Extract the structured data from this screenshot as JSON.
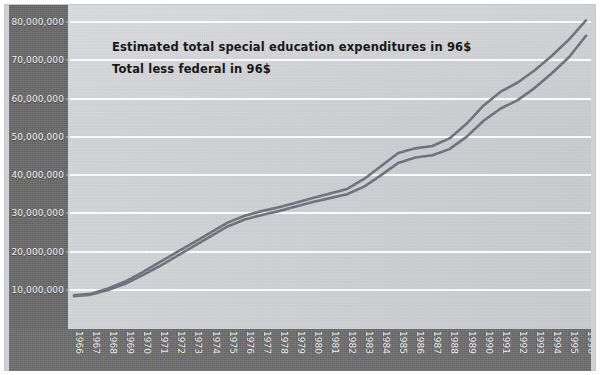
{
  "chart_data": {
    "type": "line",
    "title": "",
    "xlabel": "",
    "ylabel": "",
    "grid": true,
    "legend_position": "inside-top-left",
    "ylim": [
      0,
      84000000
    ],
    "yticks": [
      10000000,
      20000000,
      30000000,
      40000000,
      50000000,
      60000000,
      70000000,
      80000000
    ],
    "ytick_labels": [
      "10,000,000",
      "20,000,000",
      "30,000,000",
      "40,000,000",
      "50,000,000",
      "60,000,000",
      "70,000,000",
      "80,000,000"
    ],
    "categories": [
      "1966",
      "1967",
      "1968",
      "1969",
      "1970",
      "1971",
      "1972",
      "1973",
      "1974",
      "1975",
      "1976",
      "1977",
      "1978",
      "1979",
      "1980",
      "1981",
      "1982",
      "1983",
      "1984",
      "1985",
      "1986",
      "1987",
      "1988",
      "1989",
      "1990",
      "1991",
      "1992",
      "1993",
      "1994",
      "1995",
      "1996"
    ],
    "series": [
      {
        "name": "Estimated total special education expenditures in 96$",
        "values": [
          8600000,
          9000000,
          10400000,
          12200000,
          14600000,
          17200000,
          19800000,
          22400000,
          25000000,
          27600000,
          29400000,
          30600000,
          31600000,
          32800000,
          34000000,
          35200000,
          36400000,
          39000000,
          42400000,
          45800000,
          47000000,
          47600000,
          49600000,
          53400000,
          58200000,
          61800000,
          64200000,
          67400000,
          71200000,
          75400000,
          80400000
        ]
      },
      {
        "name": "Total less federal in 96$",
        "values": [
          8400000,
          8800000,
          10000000,
          11600000,
          13800000,
          16200000,
          18800000,
          21400000,
          24000000,
          26600000,
          28400000,
          29600000,
          30600000,
          31800000,
          33000000,
          34000000,
          35000000,
          37000000,
          40000000,
          43200000,
          44600000,
          45200000,
          46800000,
          50000000,
          54200000,
          57400000,
          59600000,
          62800000,
          66600000,
          70800000,
          76400000
        ]
      }
    ],
    "series_color": "#6f7178"
  },
  "legend": {
    "lines": [
      "Estimated total special education expenditures in 96$",
      "Total less federal in 96$"
    ]
  },
  "colors": {
    "plot_background": "#cbcdd1",
    "axis_band": "#6a6a6a",
    "gridline": "#fbfbfb",
    "series": "#6f7178",
    "axis_text": "#efefef",
    "legend_text": "#181818"
  }
}
